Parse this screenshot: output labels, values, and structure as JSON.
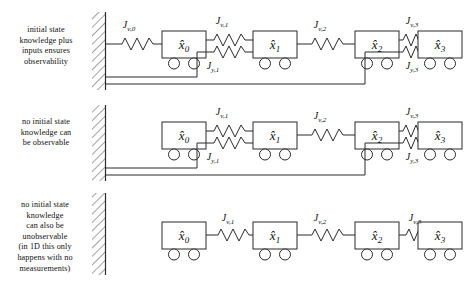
{
  "figure": {
    "type": "mass-spring-cart-observability-diagram",
    "rows": [
      {
        "id": "row-observable",
        "caption_lines": [
          "initial state",
          "knowledge plus",
          "inputs ensures",
          "observability"
        ],
        "wall": true,
        "wall_to_first_mass_spring": "J_v,0",
        "masses": [
          "x̂0",
          "x̂1",
          "x̂2",
          "x̂3"
        ],
        "v_springs": [
          "J_v,0",
          "J_v,1",
          "J_v,2",
          "J_v,3"
        ],
        "y_springs": [
          "J_y,1",
          "J_y,3"
        ],
        "ground_feedback_lines": 2
      },
      {
        "id": "row-unobservable-no-input",
        "caption_lines": [
          "no initial state",
          "knowledge can",
          "be observable"
        ],
        "wall": true,
        "wall_to_first_mass_spring": null,
        "masses": [
          "x̂0",
          "x̂1",
          "x̂2",
          "x̂3"
        ],
        "v_springs": [
          "J_v,1",
          "J_v,2",
          "J_v,3"
        ],
        "y_springs": [
          "J_y,1",
          "J_y,3"
        ],
        "ground_feedback_lines": 2
      },
      {
        "id": "row-unobservable-no-measurement",
        "caption_lines": [
          "no initial state",
          "knowledge",
          "can also be",
          "unobservable",
          "(in 1D this only",
          "happens with no",
          "measurements)"
        ],
        "wall": true,
        "wall_to_first_mass_spring": null,
        "masses": [
          "x̂0",
          "x̂1",
          "x̂2",
          "x̂3"
        ],
        "v_springs": [
          "J_v,1",
          "J_v,2",
          "J_v,3"
        ],
        "y_springs": [],
        "ground_feedback_lines": 0
      }
    ],
    "labels": {
      "mass_0": "x̂0",
      "mass_1": "x̂1",
      "mass_2": "x̂2",
      "mass_3": "x̂3",
      "Jv0": "J",
      "Jv0_sub": "v,0",
      "Jv1_sub": "v,1",
      "Jv2_sub": "v,2",
      "Jv3_sub": "v,3",
      "Jy1_sub": "y,1",
      "Jy3_sub": "y,3",
      "J": "J"
    },
    "colors": {
      "stroke": "#2b2b2b",
      "text": "#111111",
      "background": "#ffffff"
    }
  }
}
